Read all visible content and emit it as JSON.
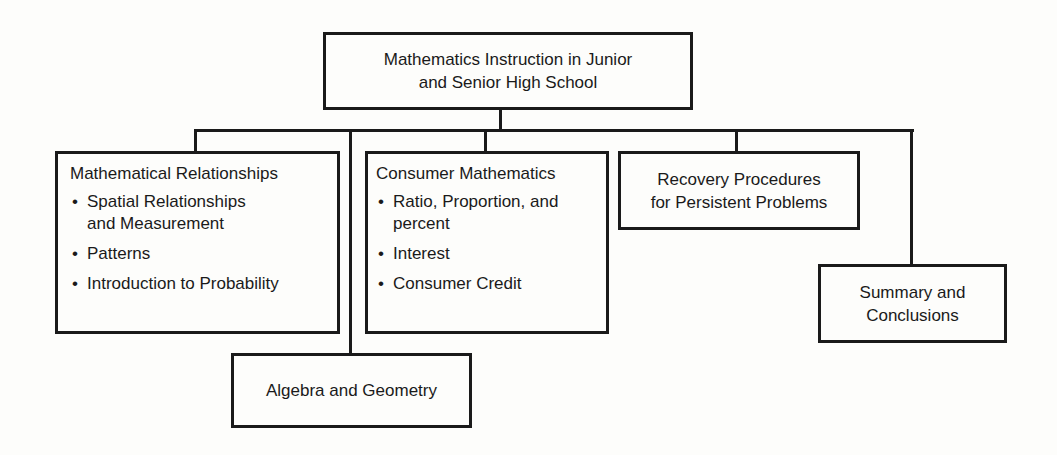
{
  "root": {
    "title_line1": "Mathematics Instruction in Junior",
    "title_line2": "and Senior High School"
  },
  "children": [
    {
      "id": "mathematical-relationships",
      "heading": "Mathematical Relationships",
      "items": [
        {
          "line1": "Spatial Relationships",
          "line2": "and Measurement"
        },
        {
          "line1": "Patterns"
        },
        {
          "line1": "Introduction to Probability"
        }
      ]
    },
    {
      "id": "algebra-geometry",
      "heading": "Algebra and Geometry"
    },
    {
      "id": "consumer-mathematics",
      "heading": "Consumer Mathematics",
      "items": [
        {
          "line1": "Ratio, Proportion, and",
          "line2": "percent"
        },
        {
          "line1": "Interest"
        },
        {
          "line1": "Consumer Credit"
        }
      ]
    },
    {
      "id": "recovery-procedures",
      "line1": "Recovery Procedures",
      "line2": "for Persistent Problems"
    },
    {
      "id": "summary-conclusions",
      "line1": "Summary and",
      "line2": "Conclusions"
    }
  ],
  "colors": {
    "ink": "#1a1a1a",
    "paper": "#fdfdfb"
  }
}
